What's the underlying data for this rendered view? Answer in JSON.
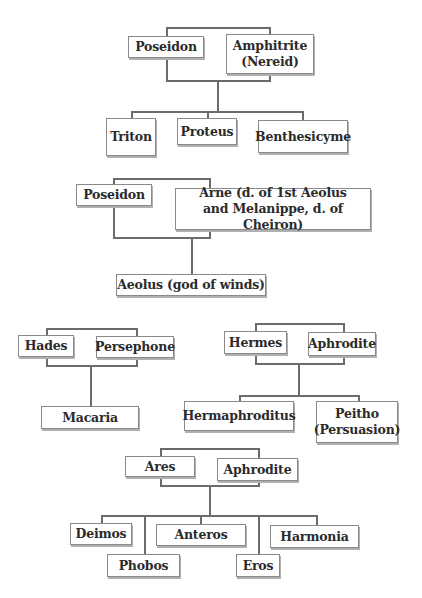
{
  "diagram": {
    "type": "genealogy",
    "families": [
      {
        "parents": [
          "Poseidon",
          "Amphitrite\n(Nereid)"
        ],
        "children": [
          "Triton",
          "Proteus",
          "Benthesicyme"
        ]
      },
      {
        "parents": [
          "Poseidon",
          "Arne (d. of 1st Aeolus\nand Melanippe, d. of Cheiron)"
        ],
        "children": [
          "Aeolus (god of winds)"
        ]
      },
      {
        "parents": [
          "Hades",
          "Persephone"
        ],
        "children": [
          "Macaria"
        ]
      },
      {
        "parents": [
          "Hermes",
          "Aphrodite"
        ],
        "children": [
          "Hermaphroditus",
          "Peitho\n(Persuasion)"
        ]
      },
      {
        "parents": [
          "Ares",
          "Aphrodite"
        ],
        "children": [
          "Deimos",
          "Phobos",
          "Anteros",
          "Eros",
          "Harmonia"
        ]
      }
    ]
  },
  "colors": {
    "line": "#6b6b6b",
    "box_border": "#8a8a8a",
    "text": "#2b2b2b",
    "background": "#ffffff"
  }
}
